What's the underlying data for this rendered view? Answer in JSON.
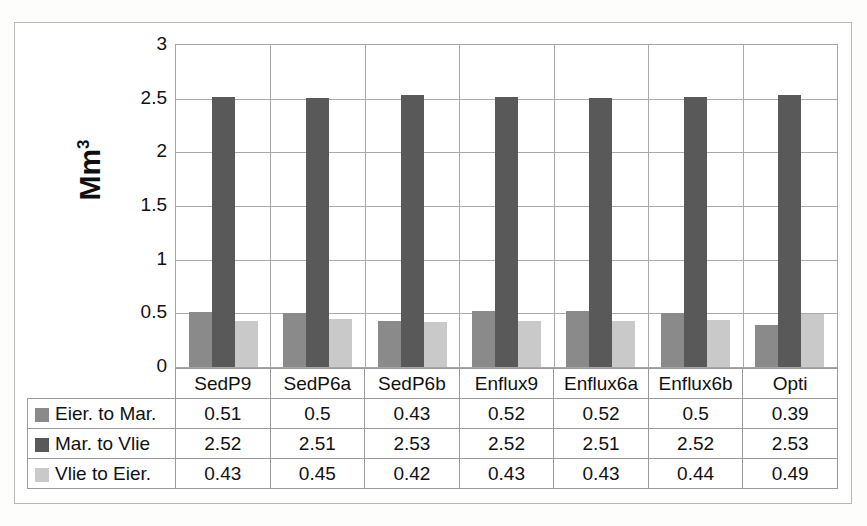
{
  "chart_data": {
    "type": "bar",
    "title": "",
    "xlabel": "",
    "ylabel": "Mm³",
    "ylim": [
      0,
      3
    ],
    "yticks": [
      "0",
      "0.5",
      "1",
      "1.5",
      "2",
      "2.5",
      "3"
    ],
    "grid": true,
    "legend_position": "data-table",
    "categories": [
      "SedP9",
      "SedP6a",
      "SedP6b",
      "Enflux9",
      "Enflux6a",
      "Enflux6b",
      "Opti"
    ],
    "series": [
      {
        "name": "Eier. to Mar.",
        "color": "#8a8a8a",
        "values": [
          0.51,
          0.5,
          0.43,
          0.52,
          0.52,
          0.5,
          0.39
        ]
      },
      {
        "name": "Mar. to Vlie",
        "color": "#595959",
        "values": [
          2.52,
          2.51,
          2.53,
          2.52,
          2.51,
          2.52,
          2.53
        ]
      },
      {
        "name": "Vlie to Eier.",
        "color": "#c9c9c9",
        "values": [
          0.43,
          0.45,
          0.42,
          0.43,
          0.43,
          0.44,
          0.49
        ]
      }
    ]
  },
  "axis": {
    "y_title_main": "Mm",
    "y_title_sup": "3"
  }
}
